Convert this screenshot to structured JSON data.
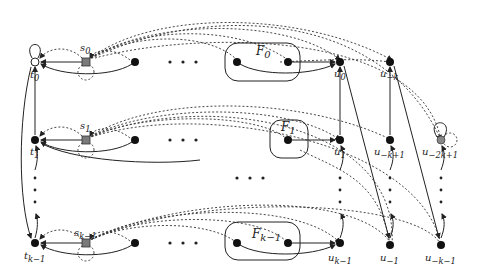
{
  "diagram": {
    "colors": {
      "node": "#111111",
      "special_node": "#7a7a7a",
      "line": "#222222"
    },
    "labels": {
      "t0": "t0",
      "t1": "t1",
      "tk1": "tk−1",
      "s0": "s0",
      "s1": "s1",
      "sk1": "sk−1",
      "F0": "F0",
      "F1": "F1",
      "Fk1": "Fk−1",
      "u0": "u0",
      "u1": "u1",
      "uk1": "uk−1",
      "umk": "u−k",
      "umk1": "u−k+1",
      "um1": "u−1",
      "um2k1": "u−2k+1",
      "umkm1": "u−k−1"
    },
    "label_parts": {
      "t0": [
        "t",
        "0"
      ],
      "t1": [
        "t",
        "1"
      ],
      "tk1": [
        "t",
        "k−1"
      ],
      "s0": [
        "s",
        "0"
      ],
      "s1": [
        "s",
        "1"
      ],
      "sk1": [
        "s",
        "k−1"
      ],
      "F0": [
        "F",
        "0"
      ],
      "F1": [
        "F",
        "1"
      ],
      "Fk1": [
        "F",
        "k−1"
      ],
      "u0": [
        "u",
        "0"
      ],
      "u1": [
        "u",
        "1"
      ],
      "uk1": [
        "u",
        "k−1"
      ],
      "umk": [
        "u",
        "−k"
      ],
      "umk1": [
        "u",
        "−k+1"
      ],
      "um1": [
        "u",
        "−1"
      ],
      "um2k1": [
        "u",
        "−2k+1"
      ],
      "umkm1": [
        "u",
        "−k−1"
      ]
    }
  }
}
